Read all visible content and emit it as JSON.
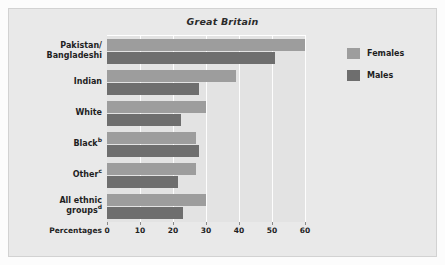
{
  "chart_data": {
    "type": "bar",
    "orientation": "horizontal",
    "title": "Great Britain",
    "xlabel": "Percentages",
    "ylabel": "",
    "xlim": [
      0,
      60
    ],
    "xticks": [
      0,
      10,
      20,
      30,
      40,
      50,
      60
    ],
    "grid": true,
    "legend_position": "right",
    "categories": [
      "Pakistan/\nBangladeshi",
      "Indian",
      "White",
      "Black",
      "Other",
      "All ethnic\ngroups"
    ],
    "category_labels": [
      {
        "line1": "Pakistan/",
        "line2": "Bangladeshi",
        "footnote": ""
      },
      {
        "line1": "Indian",
        "line2": "",
        "footnote": ""
      },
      {
        "line1": "White",
        "line2": "",
        "footnote": ""
      },
      {
        "line1": "Black",
        "line2": "",
        "footnote": "b"
      },
      {
        "line1": "Other",
        "line2": "",
        "footnote": "c"
      },
      {
        "line1": "All ethnic",
        "line2": "groups",
        "footnote": "d"
      }
    ],
    "series": [
      {
        "name": "Females",
        "color": "#9d9d9d",
        "values": [
          60,
          39,
          30,
          27,
          27,
          30
        ]
      },
      {
        "name": "Males",
        "color": "#6e6e6e",
        "values": [
          51,
          28,
          22.5,
          28,
          21.5,
          23
        ]
      }
    ]
  },
  "legend": {
    "entries": [
      {
        "label": "Females",
        "color": "#9d9d9d"
      },
      {
        "label": "Males",
        "color": "#6e6e6e"
      }
    ]
  },
  "colors": {
    "figure_background": "#e9e9e9",
    "plot_background": "#e3e3e3",
    "gridline": "#fdfdfd",
    "text": "#1f1f1f",
    "females": "#9d9d9d",
    "males": "#6e6e6e"
  }
}
